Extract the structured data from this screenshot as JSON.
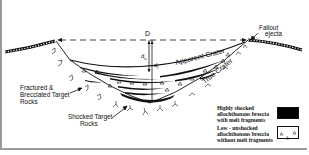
{
  "diagram": {
    "labels": {
      "diameter": "D",
      "apparent_depth": "da",
      "apparent_depth_sub": "a",
      "true_depth": "dt",
      "true_depth_sub": "t",
      "fallout_line1": "Fallout",
      "fallout_line2": "ejecta",
      "apparent_crater": "Apparent Crater",
      "true_crater": "True Crater",
      "fractured_line1": "Fractured &",
      "fractured_line2": "Brecciated Target",
      "fractured_line3": "Rocks",
      "shocked_line1": "Shocked Target",
      "shocked_line2": "Rocks"
    },
    "legend": [
      {
        "line1": "Highly shocked",
        "line2": "allochthonous breccia",
        "line3": "with melt fragments",
        "swatch": "solid-black",
        "color": "#000000"
      },
      {
        "line1": "Low - unshocked",
        "line2": "allochthonous breccia",
        "line3": "without melt fragments",
        "swatch": "white-with-triangles",
        "color": "#ffffff"
      }
    ],
    "colors": {
      "ink": "#111111",
      "frame": "#9a9a9a",
      "background": "#ffffff"
    }
  }
}
